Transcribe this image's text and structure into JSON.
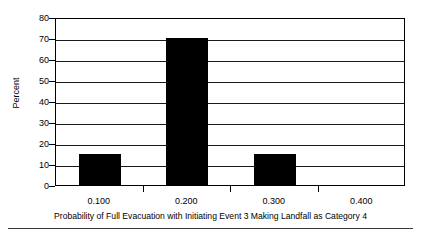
{
  "chart_data": {
    "type": "bar",
    "title": "",
    "xlabel": "Probability of Full Evacuation with Initiating Event 3 Making Landfall as Category 4",
    "ylabel": "Percent",
    "categories": [
      "0.100",
      "0.200",
      "0.300",
      "0.400"
    ],
    "values": [
      15,
      70,
      15,
      0
    ],
    "ylim": [
      0,
      80
    ],
    "yticks": [
      "0",
      "10",
      "20",
      "30",
      "40",
      "50",
      "60",
      "70",
      "80"
    ],
    "ytick_values": [
      0,
      10,
      20,
      30,
      40,
      50,
      60,
      70,
      80
    ],
    "grid": "horizontal",
    "legend": "none",
    "bar_color": "#000000",
    "plot_background": "#ffffff",
    "axis_color": "#000000"
  }
}
